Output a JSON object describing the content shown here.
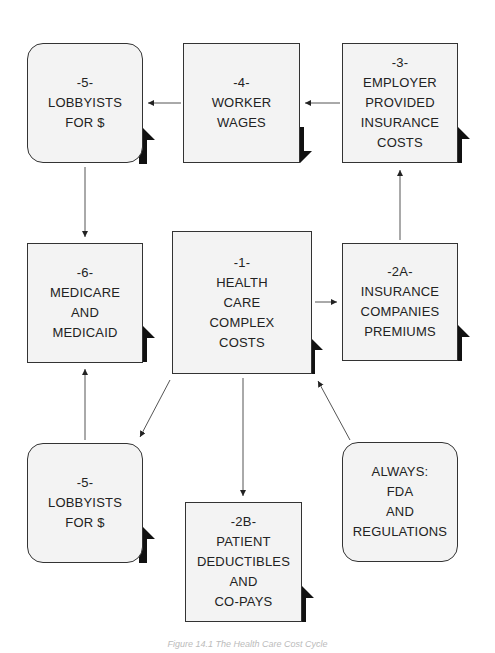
{
  "boxes": {
    "lobbyists_top": {
      "num": "-5-",
      "lines": [
        "LOBBYISTS",
        "FOR $"
      ],
      "trend": "up"
    },
    "worker_wages": {
      "num": "-4-",
      "lines": [
        "WORKER",
        "WAGES"
      ],
      "trend": "down"
    },
    "employer_costs": {
      "num": "-3-",
      "lines": [
        "EMPLOYER",
        "PROVIDED",
        "INSURANCE",
        "COSTS"
      ],
      "trend": "up"
    },
    "medicare": {
      "num": "-6-",
      "lines": [
        "MEDICARE",
        "AND",
        "MEDICAID"
      ],
      "trend": "up"
    },
    "health_care": {
      "num": "-1-",
      "lines": [
        "HEALTH",
        "CARE",
        "COMPLEX",
        "COSTS"
      ],
      "trend": "up"
    },
    "insurance_premiums": {
      "num": "-2A-",
      "lines": [
        "INSURANCE",
        "COMPANIES",
        "PREMIUMS"
      ],
      "trend": "up"
    },
    "lobbyists_bottom": {
      "num": "-5-",
      "lines": [
        "LOBBYISTS",
        "FOR $"
      ],
      "trend": "up"
    },
    "patient_deductibles": {
      "num": "-2B-",
      "lines": [
        "PATIENT",
        "DEDUCTIBLES",
        "AND",
        "CO-PAYS"
      ],
      "trend": "up"
    },
    "always_fda": {
      "num": "",
      "lines": [
        "ALWAYS:",
        "FDA",
        "AND",
        "REGULATIONS"
      ],
      "trend": "none"
    }
  },
  "caption": "Figure 14.1 The Health Care Cost Cycle",
  "colors": {
    "box_fill": "#f3f3f3",
    "border": "#333333",
    "arrow": "#111111"
  }
}
